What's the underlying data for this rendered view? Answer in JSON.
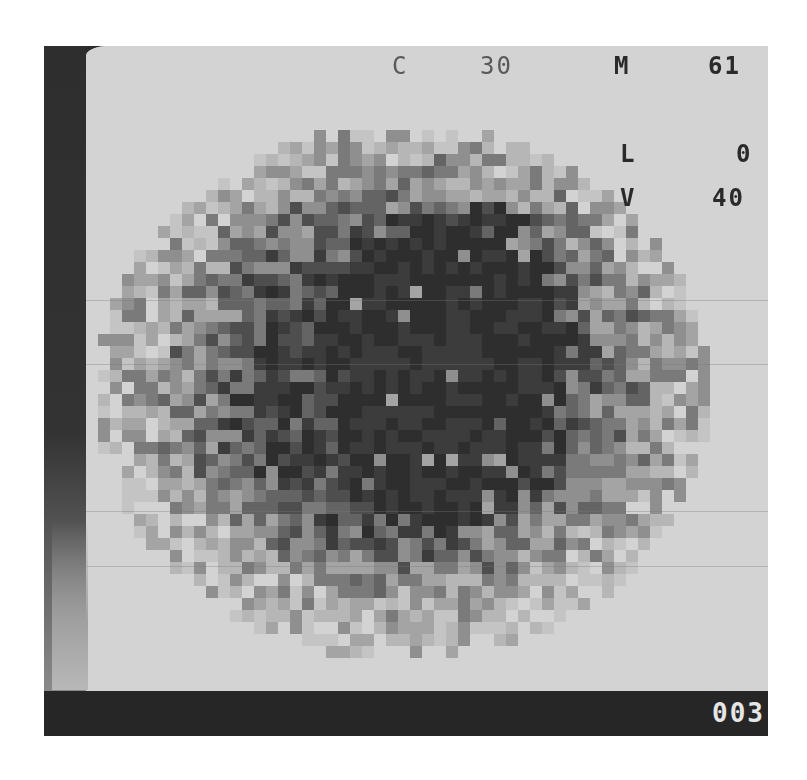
{
  "display": {
    "background_color": "#d3d3d3",
    "frame_color": "#2b2b2b",
    "frame_counter": "003"
  },
  "readouts": {
    "c": {
      "label": "C",
      "value": "30"
    },
    "m": {
      "label": "M",
      "value": "61"
    },
    "l": {
      "label": "L",
      "value": "0"
    },
    "v": {
      "label": "V",
      "value": "40"
    }
  },
  "scan_image": {
    "description": "Pixelated grayscale scintigraphy-style blob with a dark irregular core",
    "cell_size_px": 12,
    "center": [
      402,
      393
    ],
    "radius_x": 292,
    "radius_y": 256,
    "core_center": [
      450,
      370
    ],
    "core_radius_x": 140,
    "core_radius_y": 190,
    "core_color": "#2e2e2e",
    "palette": [
      "#2e2e2e",
      "#3c3c3c",
      "#4e4e4e",
      "#646464",
      "#7a7a7a",
      "#8f8f8f",
      "#a4a4a4",
      "#b6b6b6",
      "#c4c4c4"
    ],
    "seed": 1977
  }
}
